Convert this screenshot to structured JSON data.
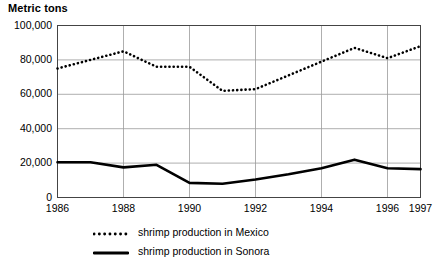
{
  "chart_data": {
    "type": "line",
    "title": "Metric tons",
    "xlabel": "",
    "ylabel": "Metric tons",
    "xlim": [
      1986,
      1997
    ],
    "ylim": [
      0,
      100000
    ],
    "grid": true,
    "legend_position": "bottom",
    "y_ticks": [
      {
        "value": 0,
        "label": "0"
      },
      {
        "value": 20000,
        "label": "20,000"
      },
      {
        "value": 40000,
        "label": "40,000"
      },
      {
        "value": 60000,
        "label": "60,000"
      },
      {
        "value": 80000,
        "label": "80,000"
      },
      {
        "value": 100000,
        "label": "100,000"
      }
    ],
    "x_ticks": [
      {
        "value": 1986,
        "label": "1986"
      },
      {
        "value": 1988,
        "label": "1988"
      },
      {
        "value": 1990,
        "label": "1990"
      },
      {
        "value": 1992,
        "label": "1992"
      },
      {
        "value": 1994,
        "label": "1994"
      },
      {
        "value": 1996,
        "label": "1996"
      },
      {
        "value": 1997,
        "label": "1997"
      }
    ],
    "x": [
      1986,
      1987,
      1988,
      1989,
      1990,
      1991,
      1992,
      1993,
      1994,
      1995,
      1996,
      1997
    ],
    "series": [
      {
        "name": "shrimp production in Mexico",
        "style": "dotted",
        "color": "#000000",
        "values": [
          75000,
          80000,
          85000,
          76000,
          76000,
          62000,
          63000,
          71000,
          79000,
          87000,
          81000,
          88000
        ]
      },
      {
        "name": "shrimp production in Sonora",
        "style": "solid",
        "color": "#000000",
        "values": [
          20500,
          20500,
          17500,
          19000,
          8500,
          8000,
          10500,
          13500,
          17000,
          22000,
          17000,
          16500
        ]
      }
    ]
  },
  "legend": {
    "items": [
      {
        "label": "shrimp production in Mexico",
        "style": "dotted"
      },
      {
        "label": "shrimp production in Sonora",
        "style": "solid"
      }
    ]
  }
}
